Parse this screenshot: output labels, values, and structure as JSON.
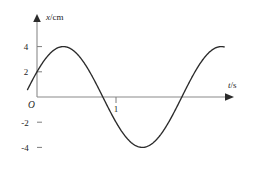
{
  "figure": {
    "background_color": "#ffffff",
    "curve_color": "#2b2b2b",
    "axis_color": "#8a8a8a",
    "watermark_text": ""
  },
  "axes": {
    "y_axis_label": "x/cm",
    "y_axis_symbol": "x",
    "y_axis_unit": "/cm",
    "x_axis_label": "t/s",
    "x_axis_symbol": "t",
    "x_axis_unit": "/s",
    "origin_label": "O"
  },
  "ticks": {
    "y_labels": [
      "4",
      "2",
      "-2",
      "-4"
    ],
    "y_values": [
      4,
      2,
      -2,
      -4
    ],
    "x_labels": [
      "1"
    ],
    "x_values": [
      1
    ]
  },
  "chart_data": {
    "type": "line",
    "title": "",
    "subtitle": "",
    "xlabel": "t/s",
    "ylabel": "x/cm",
    "grid": false,
    "legend": null,
    "xlim": [
      -0.12,
      2.4
    ],
    "ylim": [
      -5.0,
      5.0
    ],
    "xticks": [
      1
    ],
    "xticklabels": [
      "1"
    ],
    "yticks": [
      -4,
      -2,
      2,
      4
    ],
    "yticklabels": [
      "-4",
      "-2",
      "2",
      "4"
    ],
    "annotations": [
      {
        "text": "O",
        "note": "origin label at axes intersection"
      }
    ],
    "series": [
      {
        "name": "displacement",
        "equation": "x = 4 sin(pi*t + pi/6)",
        "amplitude": 4,
        "period": 2,
        "phase_deg": 30,
        "units": "cm",
        "value_at_t0": 2,
        "peak": {
          "t": 0.333,
          "x": 4
        },
        "zero_crossing": {
          "t": 1,
          "x": 0
        },
        "trough": {
          "t": 1.333,
          "x": -4
        },
        "x": [
          -0.17,
          -0.1,
          0.0,
          0.1,
          0.2,
          0.3,
          0.333,
          0.4,
          0.5,
          0.6,
          0.7,
          0.8,
          0.9,
          1.0,
          1.1,
          1.2,
          1.3,
          1.333,
          1.4,
          1.5,
          1.6,
          1.7,
          1.8,
          1.9,
          2.0,
          2.1
        ],
        "values": [
          0.0,
          0.63,
          2.0,
          2.93,
          3.6,
          3.96,
          4.0,
          3.94,
          3.46,
          2.71,
          1.74,
          0.63,
          -0.52,
          -2.0,
          -2.93,
          -3.6,
          -3.96,
          -4.0,
          -3.94,
          -3.46,
          -2.71,
          -1.74,
          -0.63,
          0.52,
          2.0,
          2.93
        ]
      }
    ]
  }
}
